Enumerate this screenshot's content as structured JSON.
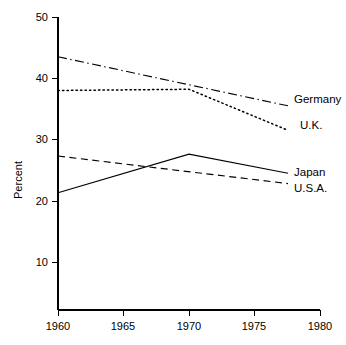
{
  "chart_data": {
    "type": "line",
    "title": "",
    "subtitle": "",
    "xlabel": "",
    "ylabel": "Percent",
    "xlim": [
      1960,
      1980
    ],
    "ylim": [
      0,
      50
    ],
    "x_ticks": [
      "1960",
      "1965",
      "1970",
      "1975",
      "1980"
    ],
    "x_tick_values": [
      1960,
      1965,
      1970,
      1975,
      1980
    ],
    "y_ticks": [
      "10",
      "20",
      "30",
      "40",
      "50"
    ],
    "y_tick_values": [
      10,
      20,
      30,
      40,
      50
    ],
    "grid": false,
    "legend_position": "right-inline-labels",
    "series": [
      {
        "name": "Germany",
        "line_style": "dash-dot",
        "color": "#000000",
        "x": [
          1960,
          1980
        ],
        "values": [
          43.5,
          35.5
        ]
      },
      {
        "name": "U.K.",
        "line_style": "dotted",
        "color": "#000000",
        "x": [
          1960,
          1970,
          1980
        ],
        "values": [
          38.0,
          38.2,
          31.5
        ]
      },
      {
        "name": "Japan",
        "line_style": "solid",
        "color": "#000000",
        "x": [
          1960,
          1970,
          1980
        ],
        "values": [
          21.3,
          27.6,
          24.5
        ]
      },
      {
        "name": "U.S.A.",
        "line_style": "dashed",
        "color": "#000000",
        "x": [
          1960,
          1980
        ],
        "values": [
          27.3,
          22.8
        ]
      }
    ],
    "annotations": [
      {
        "text": "Germany",
        "series": "Germany"
      },
      {
        "text": "U.K.",
        "series": "U.K."
      },
      {
        "text": "Japan",
        "series": "Japan"
      },
      {
        "text": "U.S.A.",
        "series": "U.S.A."
      }
    ]
  }
}
